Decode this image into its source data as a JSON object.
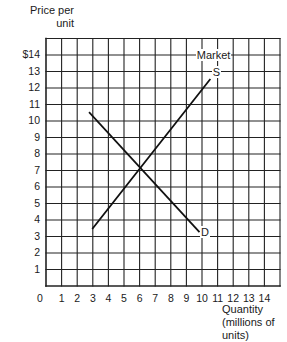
{
  "chart_data": {
    "type": "line",
    "title": "Market",
    "xlabel": "Quantity (millions of units)",
    "ylabel": "Price per unit",
    "xlim": [
      0,
      15
    ],
    "ylim": [
      0,
      15
    ],
    "grid": true,
    "x_ticks": [
      "0",
      "1",
      "2",
      "3",
      "4",
      "5",
      "6",
      "7",
      "8",
      "9",
      "10",
      "11",
      "12",
      "13",
      "14"
    ],
    "y_ticks": [
      "1",
      "2",
      "3",
      "4",
      "5",
      "6",
      "7",
      "8",
      "9",
      "10",
      "11",
      "12",
      "13",
      "$14"
    ],
    "series": [
      {
        "name": "S",
        "label": "S",
        "points": [
          [
            3.0,
            3.5
          ],
          [
            10.5,
            12.5
          ]
        ]
      },
      {
        "name": "D",
        "label": "D",
        "points": [
          [
            2.8,
            10.5
          ],
          [
            9.8,
            3.3
          ]
        ]
      }
    ],
    "equilibrium": {
      "quantity": 6,
      "price": 7
    }
  },
  "labels": {
    "ylabel_line1": "Price per",
    "ylabel_line2": "unit",
    "xlabel_line1": "Quantity",
    "xlabel_line2": "(millions of",
    "xlabel_line3": "units)",
    "title": "Market",
    "supply": "S",
    "demand": "D"
  }
}
